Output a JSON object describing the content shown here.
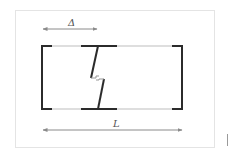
{
  "diagram": {
    "labels": {
      "delta": "Δ",
      "length": "L"
    },
    "colors": {
      "thick_line": "#2b2b2b",
      "thin_line": "#bdbdbd",
      "arrow": "#8a8a8a",
      "frame": "#e4e4e4"
    },
    "elements": {
      "rectangle": {
        "left": 42,
        "top": 45,
        "right": 182,
        "bottom": 110
      },
      "delta_arrow": {
        "x1": 43,
        "x2": 97,
        "y": 29
      },
      "length_arrow": {
        "x1": 43,
        "x2": 182,
        "y": 130
      }
    }
  }
}
